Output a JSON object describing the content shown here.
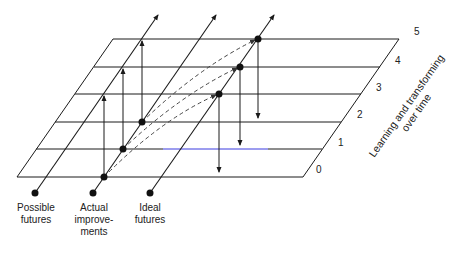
{
  "diagram": {
    "levels": [
      "0",
      "1",
      "2",
      "3",
      "4",
      "5"
    ],
    "axis_title_line1": "Learning and transforming",
    "axis_title_line2": "over time",
    "trajectories": [
      {
        "id": "possible",
        "label_line1": "Possible",
        "label_line2": "futures",
        "label_line3": ""
      },
      {
        "id": "actual",
        "label_line1": "Actual",
        "label_line2": "improve-",
        "label_line3": "ments"
      },
      {
        "id": "ideal",
        "label_line1": "Ideal",
        "label_line2": "futures",
        "label_line3": ""
      }
    ],
    "colors": {
      "line": "#1a1a1a",
      "dashed": "#555555",
      "highlight_line": "#3a3adf"
    }
  }
}
